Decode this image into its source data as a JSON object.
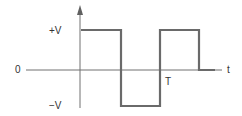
{
  "diagram": {
    "type": "square-wave",
    "labels": {
      "plus_v": "+V",
      "minus_v": "−V",
      "zero": "0",
      "time_axis": "t",
      "period": "T"
    },
    "colors": {
      "axis": "#707070",
      "waveform": "#6a6a6a",
      "text": "#333333"
    },
    "waveform_levels": [
      "+V",
      "−V",
      "+V",
      "0"
    ],
    "waveform_segments_in_periods": [
      0,
      0.5,
      1.0,
      1.5
    ]
  }
}
